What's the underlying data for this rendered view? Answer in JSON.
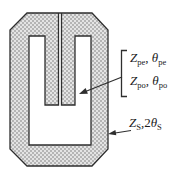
{
  "figure": {
    "kind": "resonator-structure-diagram",
    "labels": {
      "coupled_lines": {
        "line1": {
          "z": "Z",
          "z_sub": "pe",
          "sep": ", ",
          "theta": "θ",
          "theta_sub": "pe"
        },
        "line2": {
          "z": "Z",
          "z_sub": "po",
          "sep": ", ",
          "theta": "θ",
          "theta_sub": "po"
        }
      },
      "stub": {
        "z": "Z",
        "z_sub": "S",
        "sep": ",2",
        "theta": "θ",
        "theta_sub": "S"
      }
    },
    "colors": {
      "ink": "#2e2e2e",
      "fill_light": "#e4e4e4",
      "fill_dot": "#b5b5b5",
      "background": "#ffffff"
    }
  }
}
